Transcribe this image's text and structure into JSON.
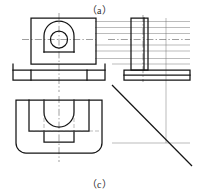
{
  "figure": {
    "caption_top": "（a）",
    "caption_bottom": "（c）",
    "line_colors": {
      "outline": "#1a1a1a",
      "thin": "#5a5a5a",
      "center": "#4a4a4a",
      "background": "#ffffff"
    }
  },
  "views": {
    "front": {
      "label": "front-view",
      "description": "Bracket front elevation: rectangular body with arched boss and through hole, stepped base plate"
    },
    "right": {
      "label": "right-side-view",
      "description": "Right side elevation: tall vertical rib standing on a wide base plate"
    },
    "top": {
      "label": "top-view",
      "description": "Plan view: rounded rectangular plate with semicircular U cutout and inner rectangular recess"
    }
  },
  "annotations": {
    "leader_line": "diagonal-leader-line"
  }
}
